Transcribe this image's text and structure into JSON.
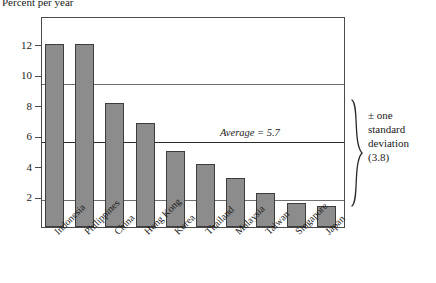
{
  "chart_data": {
    "type": "bar",
    "title": "Percent per year",
    "xlabel": "",
    "ylabel": "Percent per year",
    "categories": [
      "Indonesia",
      "Philippines",
      "China",
      "Hong Kong",
      "Korea",
      "Thailand",
      "Malaysia",
      "Taiwan",
      "Singapore",
      "Japan"
    ],
    "values": [
      12.0,
      12.0,
      8.1,
      6.8,
      5.0,
      4.1,
      3.2,
      2.2,
      1.6,
      1.4
    ],
    "ylim": [
      0,
      13.8
    ],
    "yticks": [
      2,
      4,
      6,
      8,
      10,
      12
    ],
    "ytick_labels": [
      "2",
      "4",
      "6",
      "8",
      "10",
      "12"
    ],
    "grid": false,
    "legend": "none",
    "series_color": "#8c8c8c",
    "annotations": {
      "average_value": 5.7,
      "average_label": "Average = 5.7",
      "sd_value": 3.8,
      "sd_upper": 9.5,
      "sd_lower": 1.9,
      "sd_label_line1": "± one",
      "sd_label_line2": "standard",
      "sd_label_line3": "deviation",
      "sd_label_line4": "(3.8)"
    }
  }
}
